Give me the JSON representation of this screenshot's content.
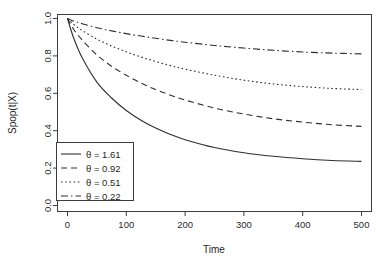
{
  "figure": {
    "title_fragment": "",
    "background": "#ffffff",
    "line_color": "#2e2e2e",
    "axis_color": "#3d3d3d"
  },
  "chart_data": {
    "type": "line",
    "title": "",
    "xlabel": "Time",
    "ylabel": "Spop(t|X)",
    "xlim": [
      0,
      500
    ],
    "ylim": [
      0.0,
      1.0
    ],
    "xticks": [
      0,
      100,
      200,
      300,
      400,
      500
    ],
    "xtick_labels": [
      "0",
      "100",
      "200",
      "300",
      "400",
      "500"
    ],
    "yticks": [
      0.0,
      0.2,
      0.4,
      0.6,
      0.8,
      1.0
    ],
    "ytick_labels": [
      "0.0",
      "0.2",
      "0.4",
      "0.6",
      "0.8",
      "1.0"
    ],
    "grid": false,
    "legend_position": "bottom-left",
    "legend_title": "",
    "series": [
      {
        "name": "θ = 1.61",
        "theta": 1.61,
        "linestyle": "solid",
        "dash_pattern": "none",
        "x": [
          0,
          10,
          25,
          50,
          75,
          100,
          125,
          150,
          175,
          200,
          250,
          300,
          350,
          400,
          450,
          500
        ],
        "values": [
          1.0,
          0.9,
          0.79,
          0.66,
          0.575,
          0.508,
          0.456,
          0.414,
          0.38,
          0.352,
          0.31,
          0.282,
          0.263,
          0.25,
          0.241,
          0.236
        ]
      },
      {
        "name": "θ = 0.92",
        "theta": 0.92,
        "linestyle": "dashed",
        "dash_pattern": "6,4",
        "x": [
          0,
          10,
          25,
          50,
          75,
          100,
          125,
          150,
          175,
          200,
          250,
          300,
          350,
          400,
          450,
          500
        ],
        "values": [
          1.0,
          0.944,
          0.885,
          0.805,
          0.745,
          0.696,
          0.655,
          0.62,
          0.59,
          0.564,
          0.521,
          0.489,
          0.464,
          0.446,
          0.432,
          0.423
        ]
      },
      {
        "name": "θ = 0.51",
        "theta": 0.51,
        "linestyle": "dotted",
        "dash_pattern": "1.6,2.6",
        "x": [
          0,
          10,
          25,
          50,
          75,
          100,
          125,
          150,
          175,
          200,
          250,
          300,
          350,
          400,
          450,
          500
        ],
        "values": [
          1.0,
          0.97,
          0.936,
          0.89,
          0.853,
          0.822,
          0.794,
          0.77,
          0.748,
          0.729,
          0.697,
          0.67,
          0.65,
          0.636,
          0.626,
          0.62
        ]
      },
      {
        "name": "θ = 0.22",
        "theta": 0.22,
        "linestyle": "dashdot",
        "dash_pattern": "7,3,1.5,3",
        "x": [
          0,
          10,
          25,
          50,
          75,
          100,
          125,
          150,
          175,
          200,
          250,
          300,
          350,
          400,
          450,
          500
        ],
        "values": [
          1.0,
          0.987,
          0.972,
          0.951,
          0.934,
          0.919,
          0.906,
          0.894,
          0.883,
          0.873,
          0.856,
          0.842,
          0.83,
          0.821,
          0.815,
          0.811
        ]
      }
    ],
    "endpoint_values_at_500": [
      0.236,
      0.423,
      0.62,
      0.811
    ]
  },
  "legend": {
    "entries": [
      {
        "label": "θ = 1.61",
        "style": "solid"
      },
      {
        "label": "θ = 0.92",
        "style": "dashed"
      },
      {
        "label": "θ = 0.51",
        "style": "dotted"
      },
      {
        "label": "θ = 0.22",
        "style": "dashdot"
      }
    ]
  }
}
